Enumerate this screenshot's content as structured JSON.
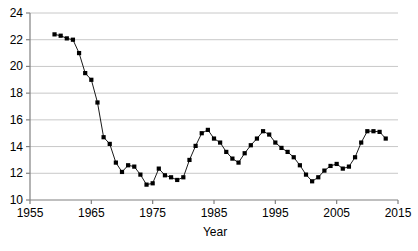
{
  "chart_data": {
    "type": "line",
    "title": "",
    "subtitle": "",
    "xlabel": "Year",
    "ylabel": "",
    "xlim": [
      1955,
      2015
    ],
    "ylim": [
      10,
      24
    ],
    "xticks": [
      1955,
      1965,
      1975,
      1985,
      1995,
      2005,
      2015
    ],
    "yticks": [
      10,
      12,
      14,
      16,
      18,
      20,
      22,
      24
    ],
    "grid": "horizontal",
    "legend": "none",
    "marker": "square",
    "marker_color": "#000000",
    "line_color": "#000000",
    "grid_color": "#c8c8c8",
    "axis_color": "#808080",
    "background": "#ffffff",
    "x": [
      1959,
      1960,
      1961,
      1962,
      1963,
      1964,
      1965,
      1966,
      1967,
      1968,
      1969,
      1970,
      1971,
      1972,
      1973,
      1974,
      1975,
      1976,
      1977,
      1978,
      1979,
      1980,
      1981,
      1982,
      1983,
      1984,
      1985,
      1986,
      1987,
      1988,
      1989,
      1990,
      1991,
      1992,
      1993,
      1994,
      1995,
      1996,
      1997,
      1998,
      1999,
      2000,
      2001,
      2002,
      2003,
      2004,
      2005,
      2006,
      2007,
      2008,
      2009,
      2010,
      2011,
      2012,
      2013
    ],
    "values": [
      22.4,
      22.3,
      22.1,
      22.0,
      21.0,
      19.5,
      19.0,
      17.3,
      14.7,
      14.2,
      12.8,
      12.1,
      12.6,
      12.5,
      11.9,
      11.15,
      11.25,
      12.35,
      11.85,
      11.7,
      11.5,
      11.7,
      13.0,
      14.05,
      15.0,
      15.25,
      14.6,
      14.3,
      13.6,
      13.1,
      12.8,
      13.5,
      14.1,
      14.6,
      15.15,
      14.9,
      14.3,
      13.9,
      13.6,
      13.2,
      12.6,
      11.9,
      11.4,
      11.7,
      12.2,
      12.55,
      12.7,
      12.35,
      12.5,
      13.2,
      14.3,
      15.15,
      15.15,
      15.1,
      14.6
    ],
    "series_name": "rate"
  },
  "axes": {
    "ytick_labels": [
      "24",
      "22",
      "20",
      "18",
      "16",
      "14",
      "12",
      "10"
    ],
    "xtick_labels": [
      "1955",
      "1965",
      "1975",
      "1985",
      "1995",
      "2005",
      "2015"
    ],
    "xlabel_text": "Year"
  }
}
